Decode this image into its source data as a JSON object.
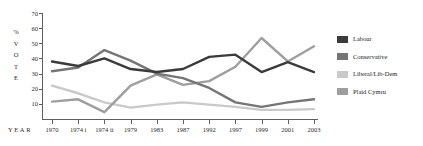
{
  "chart_data": {
    "type": "line",
    "title": "",
    "xlabel": "YEAR",
    "ylabel": "% VOTE",
    "categories": [
      "1970",
      "1974 i",
      "1974 ii",
      "1979",
      "1983",
      "1987",
      "1992",
      "1997",
      "1999",
      "2001",
      "2003"
    ],
    "ylim": [
      0,
      70
    ],
    "yticks": [
      10,
      20,
      30,
      40,
      50,
      60,
      70
    ],
    "grid": false,
    "legend_position": "right",
    "series": [
      {
        "name": "Labour",
        "color": "#3b3b3b",
        "values": [
          38,
          35,
          40,
          33,
          31,
          33,
          41,
          42.5,
          31,
          37.5,
          31
        ]
      },
      {
        "name": "Conservative",
        "color": "#757575",
        "values": [
          31.5,
          34,
          45.5,
          38.5,
          30,
          27,
          20.5,
          11,
          8,
          11,
          13
        ]
      },
      {
        "name": "Liberal/Lib-Dem",
        "color": "#c9c9c9",
        "values": [
          22,
          17,
          11,
          7.5,
          9.5,
          11,
          9.5,
          8,
          6,
          6,
          6.5
        ]
      },
      {
        "name": "Plaid Cymru",
        "color": "#9e9e9e",
        "values": [
          11.5,
          13,
          4.5,
          22,
          29.5,
          22.5,
          25,
          34.5,
          53.5,
          38,
          48
        ]
      }
    ]
  },
  "axis": {
    "y_caption_chars": [
      "%",
      "V",
      "O",
      "T",
      "E"
    ],
    "x_caption": "YEAR"
  },
  "legend": {
    "items": [
      {
        "label": "Labour"
      },
      {
        "label": "Conservative"
      },
      {
        "label": "Liberal/Lib-Dem"
      },
      {
        "label": "Plaid Cymru"
      }
    ]
  }
}
